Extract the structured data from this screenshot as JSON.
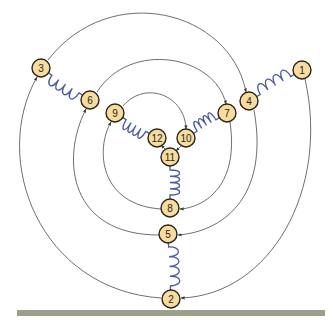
{
  "diagram": {
    "type": "spring-node cycle diagram",
    "colors": {
      "node_fill": "#f6dc9e",
      "node_stroke": "#2b2416",
      "spring": "#4b5a9a",
      "arrow": "#4a4a4a",
      "ground": "#9aa08a"
    },
    "nodes": [
      {
        "id": "1",
        "label": "1"
      },
      {
        "id": "2",
        "label": "2"
      },
      {
        "id": "3",
        "label": "3"
      },
      {
        "id": "4",
        "label": "4"
      },
      {
        "id": "5",
        "label": "5"
      },
      {
        "id": "6",
        "label": "6"
      },
      {
        "id": "7",
        "label": "7"
      },
      {
        "id": "8",
        "label": "8"
      },
      {
        "id": "9",
        "label": "9"
      },
      {
        "id": "10",
        "label": "10"
      },
      {
        "id": "11",
        "label": "11"
      },
      {
        "id": "12",
        "label": "12"
      }
    ],
    "springs": [
      {
        "from": "1",
        "to": "4"
      },
      {
        "from": "3",
        "to": "6"
      },
      {
        "from": "2",
        "to": "5"
      },
      {
        "from": "7",
        "to": "10"
      },
      {
        "from": "9",
        "to": "12"
      },
      {
        "from": "8",
        "to": "11"
      }
    ],
    "arrows": [
      {
        "from": "1",
        "to": "2"
      },
      {
        "from": "2",
        "to": "3"
      },
      {
        "from": "3",
        "to": "4"
      },
      {
        "from": "4",
        "to": "5"
      },
      {
        "from": "5",
        "to": "6"
      },
      {
        "from": "6",
        "to": "7"
      },
      {
        "from": "7",
        "to": "8"
      },
      {
        "from": "8",
        "to": "9"
      },
      {
        "from": "9",
        "to": "10"
      },
      {
        "from": "10",
        "to": "11"
      },
      {
        "from": "11",
        "to": "12"
      }
    ],
    "ground": {
      "label": "ground"
    }
  }
}
